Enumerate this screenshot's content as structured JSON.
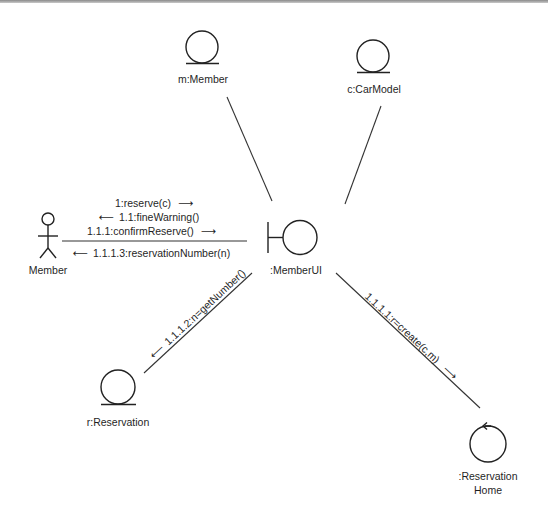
{
  "diagram": {
    "type": "UML collaboration (communication) diagram",
    "colors": {
      "line": "#333333",
      "text": "#1f1f1f",
      "background": "#ffffff"
    },
    "objects": [
      {
        "id": "m_member",
        "label": "m:Member",
        "stereotype": "entity"
      },
      {
        "id": "c_carmodel",
        "label": "c:CarModel",
        "stereotype": "entity"
      },
      {
        "id": "actor_member",
        "label": "Member",
        "stereotype": "actor"
      },
      {
        "id": "member_ui",
        "label": ":MemberUI",
        "stereotype": "boundary"
      },
      {
        "id": "r_reservation",
        "label": "r:Reservation",
        "stereotype": "entity"
      },
      {
        "id": "reservation_home",
        "label_line1": ":Reservation",
        "label_line2": "Home",
        "stereotype": "control"
      }
    ],
    "links": [
      {
        "from": "m:Member",
        "to": ":MemberUI"
      },
      {
        "from": "c:CarModel",
        "to": ":MemberUI"
      },
      {
        "from": "Member",
        "to": ":MemberUI"
      },
      {
        "from": ":MemberUI",
        "to": "r:Reservation"
      },
      {
        "from": ":MemberUI",
        "to": ":ReservationHome"
      }
    ],
    "messages": {
      "m1": {
        "text": "1:reserve(c)",
        "direction": "right",
        "arrow": "⟶"
      },
      "m2": {
        "text": "1.1:fineWarning()",
        "direction": "left",
        "arrow": "⟵"
      },
      "m3": {
        "text": "1.1.1:confirmReserve()",
        "direction": "right",
        "arrow": "⟶"
      },
      "m4": {
        "text": "1.1.1.3:reservationNumber(n)",
        "direction": "left",
        "arrow": "⟵"
      },
      "m5": {
        "text": "1.1.1.2:n=getNumber()",
        "direction": "down-left",
        "arrow": "⟵"
      },
      "m6": {
        "text": "1.1.1.1:r=create(c,m)",
        "direction": "down-right",
        "arrow": "⟶"
      }
    }
  }
}
